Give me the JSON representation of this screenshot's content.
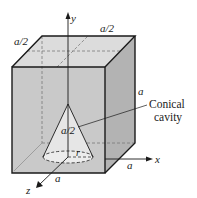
{
  "diagram": {
    "labels": {
      "top_left_dim": "a/2",
      "top_back_dim": "a/2",
      "right_height_dim": "a",
      "cone_height": "a/2",
      "cone_radius": "r",
      "x_dim": "a",
      "z_dim": "a",
      "callout_line1": "Conical",
      "callout_line2": "cavity"
    },
    "axes": {
      "x": "x",
      "y": "y",
      "z": "z"
    },
    "colors": {
      "front_face": "#c9c9c9",
      "top_face": "#dcdcdc",
      "side_face": "#b3b3b3",
      "cone_fill": "#e6e6e6",
      "edge": "#1a1a1a",
      "hidden": "#7a7a7a"
    }
  }
}
